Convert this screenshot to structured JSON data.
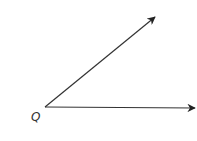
{
  "diagram": {
    "type": "angle",
    "vertex": {
      "label": "Q",
      "x": 45,
      "y": 107
    },
    "rays": [
      {
        "name": "upper-ray",
        "from": [
          45,
          107
        ],
        "to": [
          155,
          17
        ]
      },
      {
        "name": "horizontal-ray",
        "from": [
          45,
          107
        ],
        "to": [
          195,
          108
        ]
      }
    ],
    "line_color": "#333333"
  }
}
